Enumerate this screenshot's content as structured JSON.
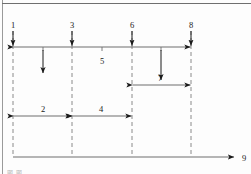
{
  "figure": {
    "title_caption": "图 图",
    "axis_label": "9",
    "colors": {
      "line": "#6f6f6f",
      "dashed": "#8a8a8a",
      "arrow": "#1a1a1a",
      "text": "#1a1a1a",
      "border": "#9a9a9a",
      "background": "#fdfdfd"
    }
  },
  "markers": [
    {
      "id": "m1",
      "label": "1",
      "x": 13
    },
    {
      "id": "m3",
      "label": "3",
      "x": 72
    },
    {
      "id": "m6",
      "label": "6",
      "x": 132
    },
    {
      "id": "m8",
      "label": "8",
      "x": 191
    }
  ],
  "spans": [
    {
      "id": "span5",
      "label": "5",
      "from": 13,
      "to": 191,
      "y": 47,
      "label_x": 102,
      "label_y": 63
    },
    {
      "id": "span7",
      "label": "7",
      "from": 132,
      "to": 191,
      "y": 85,
      "label_x": 160,
      "label_y": 80
    },
    {
      "id": "span2",
      "label": "2",
      "from": 13,
      "to": 72,
      "y": 116,
      "label_x": 43,
      "label_y": 111
    },
    {
      "id": "span4",
      "label": "4",
      "from": 72,
      "to": 132,
      "y": 116,
      "label_x": 101,
      "label_y": 111
    }
  ],
  "drop_arrows": [
    {
      "id": "drop1",
      "x": 13,
      "y1": 30,
      "y2": 46
    },
    {
      "id": "drop2",
      "x": 43,
      "y1": 50,
      "y2": 73
    },
    {
      "id": "drop3",
      "x": 72,
      "y1": 30,
      "y2": 46
    },
    {
      "id": "drop6",
      "x": 132,
      "y1": 30,
      "y2": 46
    },
    {
      "id": "drop7",
      "x": 161,
      "y1": 50,
      "y2": 80
    },
    {
      "id": "drop8",
      "x": 191,
      "y1": 30,
      "y2": 46
    }
  ],
  "baseline": {
    "id": "time-axis",
    "y": 157,
    "x_start": 13,
    "x_end": 236,
    "label": "9",
    "label_x": 244,
    "label_y": 160
  }
}
